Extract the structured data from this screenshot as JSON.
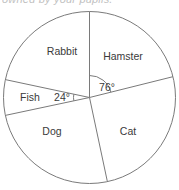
{
  "heading": {
    "text": "owned by your pupils.",
    "note": "cropped-partial-line"
  },
  "chart_data": {
    "type": "pie",
    "title": "",
    "center": {
      "x": 89.5,
      "y": 97.5
    },
    "radius": 86,
    "start_angle_deg": 0,
    "grid": false,
    "legend_position": "none",
    "categories": [
      "Hamster",
      "Cat",
      "Dog",
      "Fish",
      "Rabbit"
    ],
    "values": [
      76,
      92,
      90,
      24,
      78
    ],
    "units": "degrees",
    "labels": {
      "hamster": "Hamster",
      "cat": "Cat",
      "dog": "Dog",
      "fish": "Fish",
      "rabbit": "Rabbit"
    },
    "annotations": [
      {
        "id": "angle-76",
        "text": "76°",
        "x": 99,
        "y": 88,
        "arc": true
      },
      {
        "id": "angle-24",
        "text": "24°",
        "x": 56,
        "y": 100,
        "arc": true
      }
    ],
    "slices": [
      {
        "name": "Hamster",
        "start_deg": 0,
        "end_deg": 76,
        "label_x": 123,
        "label_y": 60
      },
      {
        "name": "Cat",
        "start_deg": 76,
        "end_deg": 168,
        "label_x": 128,
        "label_y": 135
      },
      {
        "name": "Dog",
        "start_deg": 168,
        "end_deg": 258,
        "label_x": 52,
        "label_y": 135
      },
      {
        "name": "Fish",
        "start_deg": 258,
        "end_deg": 282,
        "label_x": 30,
        "label_y": 101
      },
      {
        "name": "Rabbit",
        "start_deg": 282,
        "end_deg": 360,
        "label_x": 62,
        "label_y": 55
      }
    ]
  },
  "colors": {
    "stroke": "#7a7a7a",
    "fill": "#ffffff",
    "text": "#3a3a3a",
    "background": "#ffffff"
  }
}
